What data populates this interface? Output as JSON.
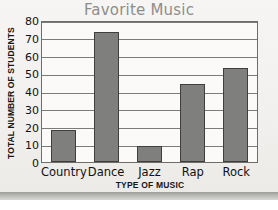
{
  "chart_data": {
    "type": "bar",
    "title": "Favorite Music",
    "xlabel": "TYPE OF MUSIC",
    "ylabel": "TOTAL NUMBER OF STUDENTS",
    "categories": [
      "Country",
      "Dance",
      "Jazz",
      "Rap",
      "Rock"
    ],
    "values": [
      18,
      73,
      9,
      44,
      53
    ],
    "ylim": [
      0,
      80
    ],
    "ytick_labels": [
      "80",
      "70",
      "60",
      "50",
      "40",
      "30",
      "20",
      "10",
      "0"
    ],
    "ytick_values": [
      80,
      70,
      60,
      50,
      40,
      30,
      20,
      10,
      0
    ],
    "ystep": 10,
    "grid": true,
    "legend": false,
    "series": [
      {
        "name": "Students",
        "values": [
          18,
          73,
          9,
          44,
          53
        ]
      }
    ],
    "colors": {
      "bar_fill": "#7f7f7d",
      "bar_border": "#3f3f3e",
      "title": "#8d8d8b",
      "axis_text": "#111111",
      "gridline": "#7b7b79",
      "plot_background": "#fbfaf8",
      "page_background": "#f2f1ef"
    }
  }
}
